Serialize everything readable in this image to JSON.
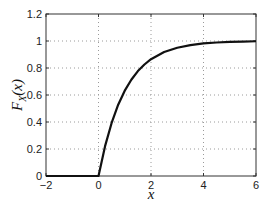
{
  "chart_data": {
    "type": "line",
    "title": "",
    "xlabel": "x",
    "ylabel": "F_X(x)",
    "ylabel_parts": {
      "main": "F",
      "sub": "X",
      "arg": "(x)"
    },
    "xlim": [
      -2,
      6
    ],
    "ylim": [
      0,
      1.2
    ],
    "xticks": [
      -2,
      0,
      2,
      4,
      6
    ],
    "xtick_labels": [
      "−2",
      "0",
      "2",
      "4",
      "6"
    ],
    "yticks": [
      0,
      0.2,
      0.4,
      0.6,
      0.8,
      1,
      1.2
    ],
    "ytick_labels": [
      "0",
      "0.2",
      "0.4",
      "0.6",
      "0.8",
      "1",
      "1.2"
    ],
    "grid": true,
    "grid_style": "dotted",
    "legend": null,
    "series": [
      {
        "name": "F_X(x)",
        "color": "#111111",
        "x": [
          -2,
          -1,
          0,
          0.25,
          0.5,
          0.75,
          1,
          1.25,
          1.5,
          1.75,
          2,
          2.5,
          3,
          3.5,
          4,
          4.5,
          5,
          5.5,
          6
        ],
        "y": [
          0,
          0,
          0,
          0.221,
          0.393,
          0.528,
          0.632,
          0.713,
          0.777,
          0.826,
          0.865,
          0.918,
          0.95,
          0.97,
          0.982,
          0.989,
          0.993,
          0.996,
          0.998
        ]
      }
    ]
  },
  "colors": {
    "axis": "#333333",
    "grid": "#9a9a9a",
    "line": "#111111",
    "background": "#ffffff"
  }
}
